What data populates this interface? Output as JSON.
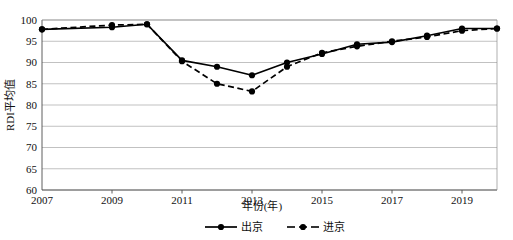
{
  "chart_data": {
    "type": "line",
    "title": "",
    "xlabel": "年份(年)",
    "ylabel": "RDI平均值",
    "x": [
      2007,
      2008,
      2009,
      2010,
      2011,
      2012,
      2013,
      2014,
      2015,
      2016,
      2017,
      2018,
      2019,
      2020
    ],
    "xtick_labels": [
      "2007",
      "2009",
      "2011",
      "2013",
      "2015",
      "2017",
      "2019"
    ],
    "xtick_values": [
      2007,
      2009,
      2011,
      2013,
      2015,
      2017,
      2019
    ],
    "ytick_labels": [
      "60",
      "65",
      "70",
      "75",
      "80",
      "85",
      "90",
      "95",
      "100"
    ],
    "ytick_values": [
      60,
      65,
      70,
      75,
      80,
      85,
      90,
      95,
      100
    ],
    "xlim": [
      2007,
      2020
    ],
    "ylim": [
      60,
      100
    ],
    "grid": "horizontal",
    "legend_position": "bottom-center",
    "series": [
      {
        "name": "出京",
        "style": "solid",
        "marker": "filled-circle",
        "color": "#000000",
        "values": [
          97.8,
          null,
          98.3,
          99.0,
          90.5,
          89.0,
          87.0,
          90.0,
          92.0,
          94.3,
          94.8,
          96.3,
          98.0,
          98.0
        ]
      },
      {
        "name": "进京",
        "style": "dashed",
        "marker": "filled-circle",
        "color": "#000000",
        "values": [
          97.8,
          null,
          98.8,
          99.0,
          90.3,
          85.0,
          83.2,
          89.0,
          92.3,
          93.8,
          95.0,
          96.0,
          97.5,
          98.0
        ]
      }
    ]
  },
  "legend": {
    "items": [
      {
        "label": "出京",
        "style": "solid"
      },
      {
        "label": "进京",
        "style": "dashed"
      }
    ]
  }
}
